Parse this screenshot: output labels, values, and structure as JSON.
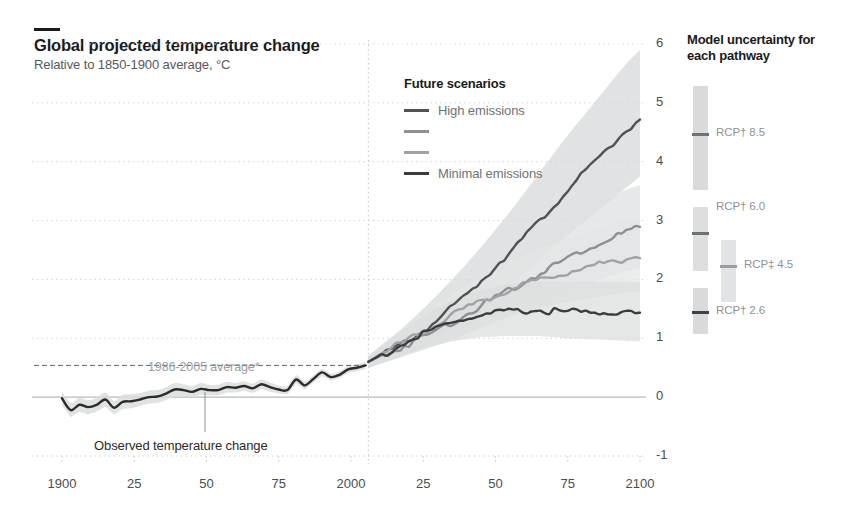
{
  "header": {
    "title": "Global projected temperature change",
    "subtitle": "Relative to 1850-1900 average, °C"
  },
  "legend_future": {
    "title": "Future scenarios",
    "items": [
      {
        "label": "High emissions",
        "color": "#4f5355",
        "show_label": true
      },
      {
        "label": "",
        "color": "#8d9194",
        "show_label": false
      },
      {
        "label": "",
        "color": "#9fa3a6",
        "show_label": false
      },
      {
        "label": "Minimal emissions",
        "color": "#3a3d3f",
        "show_label": true
      }
    ]
  },
  "legend_uncertainty": {
    "title": "Model uncertainty for each pathway",
    "items": [
      {
        "label": "RCP† 8.5",
        "color": "#6e7274",
        "band": "#d9dadb"
      },
      {
        "label": "RCP† 6.0",
        "color": "#6e7274",
        "band": "#dddedf"
      },
      {
        "label": "RCP‡ 4.5",
        "color": "#9a9ea1",
        "band": "#e2e3e4"
      },
      {
        "label": "RCP† 2.6",
        "color": "#3f4244",
        "band": "#d9dadb"
      }
    ]
  },
  "annotations": {
    "baseline": "1986-2005 average*",
    "observed": "Observed temperature change"
  },
  "chart_data": {
    "type": "line",
    "title": "Global projected temperature change",
    "subtitle": "Relative to 1850-1900 average, °C",
    "xlabel": "",
    "ylabel": "°C relative to 1850-1900 average",
    "xlim": [
      1900,
      2100
    ],
    "ylim": [
      -1,
      6
    ],
    "grid": true,
    "legend_position": "inside-top-center",
    "xticks": [
      1900,
      1925,
      1950,
      1975,
      2000,
      2025,
      2050,
      2075,
      2100
    ],
    "xtick_labels": [
      "1900",
      "25",
      "50",
      "75",
      "2000",
      "25",
      "50",
      "75",
      "2100"
    ],
    "yticks": [
      -1,
      0,
      1,
      2,
      3,
      4,
      5,
      6
    ],
    "ytick_labels": [
      "-1",
      "0",
      "1",
      "2",
      "3",
      "4",
      "5",
      "6"
    ],
    "reference_lines": [
      {
        "type": "hline",
        "value": 0.54,
        "style": "dashed",
        "label": "1986-2005 average*"
      },
      {
        "type": "vline",
        "value": 2006,
        "style": "dotted",
        "label": "observed / projected split"
      }
    ],
    "series": [
      {
        "name": "Observed temperature change",
        "kind": "historical",
        "color": "#2b2b2b",
        "x": [
          1900,
          1903,
          1906,
          1909,
          1912,
          1915,
          1918,
          1921,
          1924,
          1927,
          1930,
          1933,
          1936,
          1939,
          1942,
          1945,
          1948,
          1951,
          1954,
          1957,
          1960,
          1963,
          1966,
          1969,
          1972,
          1975,
          1978,
          1981,
          1984,
          1987,
          1990,
          1993,
          1996,
          1999,
          2002,
          2005
        ],
        "y": [
          -0.02,
          -0.22,
          -0.13,
          -0.17,
          -0.13,
          -0.04,
          -0.18,
          -0.08,
          -0.07,
          -0.04,
          0.0,
          0.01,
          0.06,
          0.13,
          0.12,
          0.09,
          0.14,
          0.12,
          0.12,
          0.17,
          0.16,
          0.19,
          0.15,
          0.22,
          0.17,
          0.13,
          0.12,
          0.3,
          0.2,
          0.31,
          0.42,
          0.34,
          0.38,
          0.47,
          0.5,
          0.54
        ],
        "band_low": [
          -0.14,
          -0.34,
          -0.25,
          -0.29,
          -0.25,
          -0.16,
          -0.3,
          -0.2,
          -0.19,
          -0.15,
          -0.11,
          -0.1,
          -0.05,
          0.02,
          0.02,
          -0.01,
          0.04,
          0.03,
          0.03,
          0.08,
          0.08,
          0.11,
          0.07,
          0.14,
          0.09,
          0.06,
          0.05,
          0.23,
          0.13,
          0.25,
          0.36,
          0.28,
          0.32,
          0.41,
          0.44,
          0.48
        ],
        "band_high": [
          0.1,
          -0.1,
          -0.01,
          -0.05,
          -0.01,
          0.08,
          -0.06,
          0.04,
          0.05,
          0.07,
          0.11,
          0.12,
          0.17,
          0.24,
          0.22,
          0.19,
          0.24,
          0.21,
          0.21,
          0.26,
          0.24,
          0.27,
          0.23,
          0.3,
          0.25,
          0.2,
          0.19,
          0.37,
          0.27,
          0.37,
          0.48,
          0.4,
          0.44,
          0.53,
          0.56,
          0.6
        ]
      },
      {
        "name": "RCP† 8.5",
        "kind": "projection",
        "label": "High emissions",
        "color": "#4f5355",
        "band_color": "#d7d8d9",
        "x": [
          2006,
          2015,
          2025,
          2035,
          2045,
          2055,
          2065,
          2075,
          2085,
          2095,
          2100
        ],
        "y": [
          0.6,
          0.85,
          1.15,
          1.55,
          2.0,
          2.5,
          3.0,
          3.55,
          4.05,
          4.55,
          4.75
        ],
        "band_low": [
          0.5,
          0.65,
          0.85,
          1.15,
          1.5,
          1.9,
          2.3,
          2.75,
          3.15,
          3.55,
          3.75
        ],
        "band_high": [
          0.7,
          1.05,
          1.5,
          2.0,
          2.55,
          3.15,
          3.8,
          4.45,
          5.05,
          5.65,
          5.9
        ],
        "end_value": 4.75
      },
      {
        "name": "RCP† 6.0",
        "kind": "projection",
        "color": "#8d9194",
        "band_color": "#dfe0e1",
        "x": [
          2006,
          2015,
          2025,
          2035,
          2045,
          2055,
          2065,
          2075,
          2085,
          2095,
          2100
        ],
        "y": [
          0.6,
          0.82,
          1.05,
          1.3,
          1.58,
          1.85,
          2.12,
          2.4,
          2.62,
          2.83,
          2.9
        ],
        "band_low": [
          0.5,
          0.64,
          0.8,
          0.98,
          1.18,
          1.38,
          1.58,
          1.8,
          1.98,
          2.14,
          2.2
        ],
        "band_high": [
          0.7,
          1.0,
          1.3,
          1.62,
          1.98,
          2.32,
          2.66,
          3.0,
          3.26,
          3.52,
          3.6
        ],
        "end_value": 2.9
      },
      {
        "name": "RCP‡ 4.5",
        "kind": "projection",
        "color": "#9fa3a6",
        "band_color": "#e4e5e6",
        "x": [
          2006,
          2015,
          2025,
          2035,
          2045,
          2055,
          2065,
          2075,
          2085,
          2095,
          2100
        ],
        "y": [
          0.6,
          0.88,
          1.15,
          1.42,
          1.65,
          1.85,
          2.02,
          2.15,
          2.28,
          2.38,
          2.42
        ],
        "band_low": [
          0.5,
          0.7,
          0.9,
          1.1,
          1.26,
          1.4,
          1.52,
          1.62,
          1.7,
          1.78,
          1.8
        ],
        "band_high": [
          0.7,
          1.06,
          1.4,
          1.74,
          2.04,
          2.3,
          2.52,
          2.68,
          2.86,
          3.0,
          3.04
        ],
        "end_value": 2.42
      },
      {
        "name": "RCP† 2.6",
        "kind": "projection",
        "label": "Minimal emissions",
        "color": "#3a3d3f",
        "band_color": "#dcdddd",
        "x": [
          2006,
          2015,
          2025,
          2035,
          2045,
          2055,
          2065,
          2075,
          2085,
          2095,
          2100
        ],
        "y": [
          0.6,
          0.85,
          1.1,
          1.3,
          1.42,
          1.48,
          1.5,
          1.48,
          1.47,
          1.46,
          1.45
        ],
        "band_low": [
          0.5,
          0.66,
          0.82,
          0.95,
          1.02,
          1.04,
          1.04,
          1.0,
          0.98,
          0.96,
          0.95
        ],
        "band_high": [
          0.7,
          1.04,
          1.38,
          1.65,
          1.82,
          1.92,
          1.96,
          1.96,
          1.96,
          1.96,
          1.95
        ],
        "end_value": 1.45
      }
    ]
  }
}
